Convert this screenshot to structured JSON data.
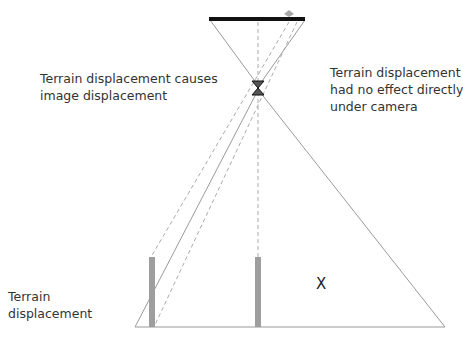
{
  "diagram": {
    "title": "",
    "labels": {
      "left_annotation_line1": "Terrain displacement causes",
      "left_annotation_line2": "image displacement",
      "right_annotation_line1": "Terrain displacement",
      "right_annotation_line2": "had no effect directly",
      "right_annotation_line3": "under camera",
      "terrain_line1": "Terrain",
      "terrain_line2": "displacement",
      "x_marker": "X"
    },
    "nodes": [
      {
        "id": "image-plane",
        "shape": "thick-line",
        "label": ""
      },
      {
        "id": "image-point-marker",
        "shape": "diamond",
        "label": ""
      },
      {
        "id": "lens",
        "shape": "hourglass",
        "label": ""
      },
      {
        "id": "terrain-bar-left",
        "shape": "vertical-bar",
        "label": ""
      },
      {
        "id": "terrain-bar-center",
        "shape": "vertical-bar",
        "label": ""
      },
      {
        "id": "ground-line",
        "shape": "line",
        "label": ""
      }
    ],
    "colors": {
      "image_plane": "#111111",
      "outline": "#9a9a9a",
      "terrain_bar": "#9e9e9e",
      "dashed": "#aaaaaa",
      "text": "#333333"
    }
  }
}
